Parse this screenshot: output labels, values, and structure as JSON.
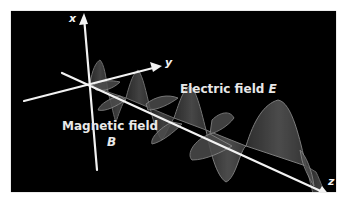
{
  "diagram": {
    "type": "electromagnetic-wave",
    "background_color": "#000000",
    "axis_color": "#f2f2f2",
    "wave_fill_color": "#555555",
    "wave_edge_color": "#9a9a9a",
    "axes": {
      "x": {
        "label": "x"
      },
      "y": {
        "label": "y"
      },
      "z": {
        "label": "z"
      }
    },
    "labels": {
      "electric_field": {
        "text": "Electric field ",
        "symbol": "E"
      },
      "magnetic_field": {
        "text": "Magnetic field",
        "symbol": "B"
      }
    }
  }
}
